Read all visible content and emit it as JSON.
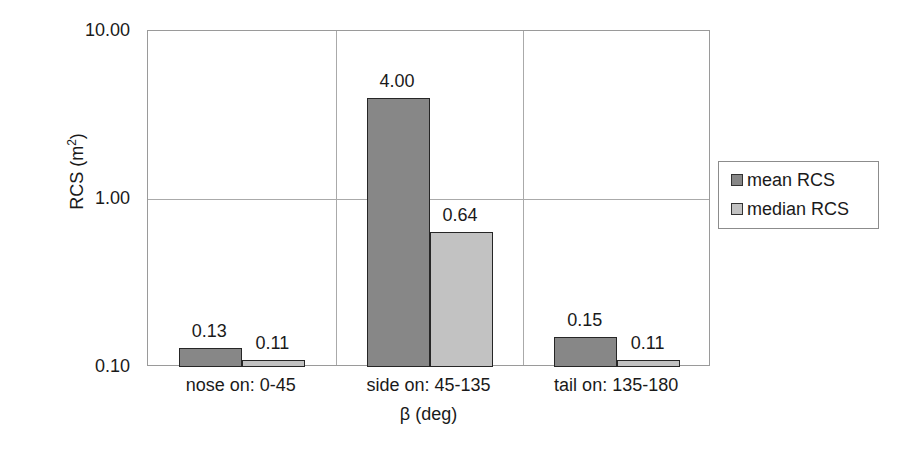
{
  "chart_data": {
    "type": "bar",
    "title": "",
    "xlabel": "β (deg)",
    "ylabel": "RCS (m²)",
    "ylabel_base": "RCS (m",
    "ylabel_sup": "2",
    "ylabel_tail": ")",
    "yscale": "log",
    "ylim": [
      0.1,
      10.0
    ],
    "ytick_labels": [
      "10.00",
      "1.00",
      "0.10"
    ],
    "ytick_values": [
      10.0,
      1.0,
      0.1
    ],
    "grid": true,
    "legend_position": "right",
    "categories": [
      "nose on:  0-45",
      "side on: 45-135",
      "tail on: 135-180"
    ],
    "series": [
      {
        "name": "mean RCS",
        "color": "#878787",
        "values": [
          0.13,
          4.0,
          0.15
        ],
        "labels": [
          "0.13",
          "4.00",
          "0.15"
        ]
      },
      {
        "name": "median RCS",
        "color": "#c2c2c2",
        "values": [
          0.11,
          0.64,
          0.11
        ],
        "labels": [
          "0.11",
          "0.64",
          "0.11"
        ]
      }
    ]
  },
  "legend": {
    "entries": [
      {
        "label": "mean RCS",
        "swatch": "mean"
      },
      {
        "label": "median RCS",
        "swatch": "median"
      }
    ]
  }
}
